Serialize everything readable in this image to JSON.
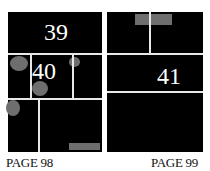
{
  "pages": [
    {
      "label": "PAGE 98",
      "panels": [
        "39",
        "40"
      ]
    },
    {
      "label": "PAGE 99",
      "panels": [
        "41"
      ]
    }
  ],
  "colors": {
    "panel": "#000000",
    "gutter": "#e8e8e8",
    "placeholder": "#6e6e6e"
  }
}
